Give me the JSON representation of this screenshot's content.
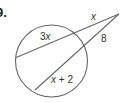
{
  "problem": {
    "number_label": "9."
  },
  "diagram": {
    "stroke_color": "#666666",
    "circle": {
      "cx": 51.5,
      "cy": 61,
      "r": 36
    },
    "external_point": {
      "x": 119,
      "y": 14
    },
    "secants": [
      {
        "name": "upper-secant",
        "near_intersection": {
          "x": 76,
          "y": 32
        },
        "far_intersection": {
          "x": 15,
          "y": 58
        },
        "external_segment_label": "x",
        "internal_segment_label": "3x"
      },
      {
        "name": "lower-secant",
        "near_intersection": {
          "x": 86,
          "y": 47
        },
        "far_intersection": {
          "x": 35,
          "y": 90
        },
        "external_segment_label": "8",
        "internal_segment_label": "x + 2"
      }
    ],
    "labels": {
      "upper_external": "x",
      "upper_internal": "3x",
      "lower_external": "8",
      "lower_internal": "x + 2"
    }
  }
}
